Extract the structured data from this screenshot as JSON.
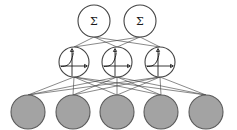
{
  "diagram": {
    "background_color": "#ffffff",
    "width": 237,
    "height": 130,
    "edge_color": "#3a3a3a",
    "node_outline_color": "#444444",
    "input_fill_color": "#a3a3a3",
    "input_stroke_color": "#5a5a5a"
  },
  "layers": [
    {
      "id": "output-layer",
      "name": "output-layer",
      "role": "output",
      "node_count": 2,
      "node_radius": 16,
      "center_y": 21,
      "node_type": "summation",
      "nodes": [
        {
          "id": "output-node-1",
          "label": "Σ",
          "cx": 94,
          "cy": 21
        },
        {
          "id": "output-node-2",
          "label": "Σ",
          "cx": 140,
          "cy": 21
        }
      ]
    },
    {
      "id": "hidden-layer",
      "name": "hidden-layer",
      "role": "hidden",
      "node_count": 3,
      "node_radius": 15,
      "center_y": 62,
      "node_type": "activation",
      "activation_glyph": "sigmoid-curve",
      "nodes": [
        {
          "id": "hidden-node-1",
          "label": "",
          "cx": 74,
          "cy": 62
        },
        {
          "id": "hidden-node-2",
          "label": "",
          "cx": 117,
          "cy": 62
        },
        {
          "id": "hidden-node-3",
          "label": "",
          "cx": 160,
          "cy": 62
        }
      ]
    },
    {
      "id": "input-layer",
      "name": "input-layer",
      "role": "input",
      "node_count": 5,
      "node_radius": 17,
      "center_y": 112,
      "node_type": "filled",
      "nodes": [
        {
          "id": "input-node-1",
          "label": "",
          "cx": 28,
          "cy": 112
        },
        {
          "id": "input-node-2",
          "label": "",
          "cx": 73,
          "cy": 112
        },
        {
          "id": "input-node-3",
          "label": "",
          "cx": 117,
          "cy": 112
        },
        {
          "id": "input-node-4",
          "label": "",
          "cx": 161,
          "cy": 112
        },
        {
          "id": "input-node-5",
          "label": "",
          "cx": 206,
          "cy": 112
        }
      ]
    }
  ],
  "connections": {
    "input_to_hidden": "fully-connected",
    "hidden_to_output": "fully-connected"
  }
}
